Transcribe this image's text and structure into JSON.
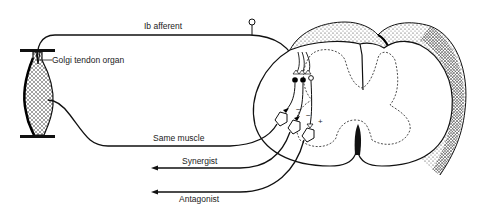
{
  "diagram": {
    "labels": {
      "ib_afferent": "Ib afferent",
      "golgi_tendon_organ": "Golgi tendon organ",
      "same_muscle": "Same muscle",
      "synergist": "Synergist",
      "antagonist": "Antagonist"
    },
    "synapse_signs": {
      "same_muscle": "−",
      "synergist": "−",
      "antagonist": "+"
    },
    "nodes": [
      {
        "id": "golgi_tendon_organ",
        "type": "receptor"
      },
      {
        "id": "muscle",
        "type": "tissue"
      },
      {
        "id": "ib_afferent",
        "type": "sensory-fiber"
      },
      {
        "id": "dorsal_root_ganglion",
        "type": "cell-body"
      },
      {
        "id": "spinal_cord",
        "type": "structure"
      },
      {
        "id": "inhibitory_interneuron_1",
        "type": "interneuron"
      },
      {
        "id": "inhibitory_interneuron_2",
        "type": "interneuron"
      },
      {
        "id": "excitatory_interneuron",
        "type": "interneuron"
      },
      {
        "id": "motor_neuron_same_muscle",
        "type": "motor-neuron"
      },
      {
        "id": "motor_neuron_synergist",
        "type": "motor-neuron"
      },
      {
        "id": "motor_neuron_antagonist",
        "type": "motor-neuron"
      }
    ],
    "edges": [
      {
        "from": "golgi_tendon_organ",
        "to": "spinal_cord",
        "label": "Ib afferent"
      },
      {
        "from": "inhibitory_interneuron_1",
        "to": "motor_neuron_same_muscle",
        "sign": "−"
      },
      {
        "from": "inhibitory_interneuron_2",
        "to": "motor_neuron_synergist",
        "sign": "−"
      },
      {
        "from": "excitatory_interneuron",
        "to": "motor_neuron_antagonist",
        "sign": "+"
      },
      {
        "from": "motor_neuron_same_muscle",
        "to": "muscle",
        "label": "Same muscle"
      },
      {
        "from": "motor_neuron_synergist",
        "to": "synergist",
        "label": "Synergist"
      },
      {
        "from": "motor_neuron_antagonist",
        "to": "antagonist",
        "label": "Antagonist"
      }
    ]
  }
}
